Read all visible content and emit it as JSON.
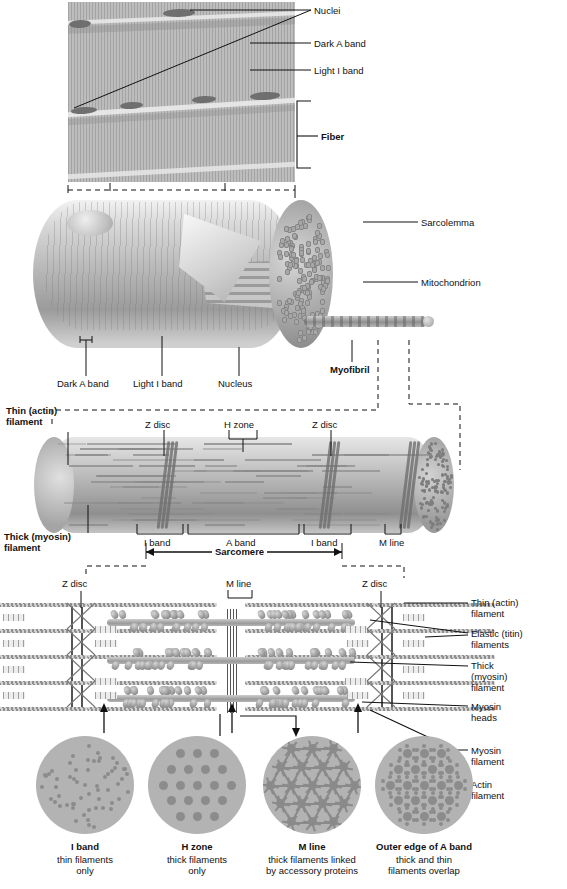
{
  "figure": {
    "domain": "anatomy-diagram"
  },
  "panel_micrograph": {
    "name": "photomicrograph-of-muscle-fibers",
    "labels": [
      {
        "id": "nuclei",
        "text": "Nuclei"
      },
      {
        "id": "dark-a-band",
        "text": "Dark A band"
      },
      {
        "id": "light-i-band",
        "text": "Light I band"
      },
      {
        "id": "fiber",
        "text": "Fiber",
        "bold": true
      }
    ]
  },
  "panel_fiber": {
    "name": "muscle-fiber-cutaway",
    "labels": [
      {
        "id": "sarcolemma",
        "text": "Sarcolemma"
      },
      {
        "id": "mitochondrion",
        "text": "Mitochondrion"
      },
      {
        "id": "myofibril",
        "text": "Myofibril",
        "bold": true
      },
      {
        "id": "dark-a-band",
        "text": "Dark A band"
      },
      {
        "id": "light-i-band",
        "text": "Light I band"
      },
      {
        "id": "nucleus",
        "text": "Nucleus"
      }
    ]
  },
  "panel_myofibril": {
    "name": "myofibril-sarcomere-structure",
    "labels": [
      {
        "id": "thin-actin-filament",
        "line1": "Thin (actin)",
        "line2": "filament",
        "bold": true
      },
      {
        "id": "thick-myosin-filament",
        "line1": "Thick (myosin)",
        "line2": "filament",
        "bold": true
      },
      {
        "id": "z-disc-left",
        "text": "Z disc"
      },
      {
        "id": "h-zone",
        "text": "H zone"
      },
      {
        "id": "z-disc-right",
        "text": "Z disc"
      },
      {
        "id": "i-band-left",
        "text": "I band"
      },
      {
        "id": "a-band",
        "text": "A band"
      },
      {
        "id": "i-band-right",
        "text": "I band"
      },
      {
        "id": "m-line",
        "text": "M line"
      },
      {
        "id": "sarcomere",
        "text": "Sarcomere",
        "bold": true
      }
    ]
  },
  "panel_filaments": {
    "name": "sarcomere-filament-arrangement",
    "labels": [
      {
        "id": "z-disc-left",
        "text": "Z disc"
      },
      {
        "id": "m-line",
        "text": "M line"
      },
      {
        "id": "z-disc-right",
        "text": "Z disc"
      },
      {
        "id": "thin-actin-filament",
        "line1": "Thin (actin)",
        "line2": "filament"
      },
      {
        "id": "elastic-titin-filaments",
        "line1": "Elastic (titin)",
        "line2": "filaments"
      },
      {
        "id": "thick-myosin-filament",
        "line1": "Thick",
        "line2": "(myosin)",
        "line3": "filament"
      },
      {
        "id": "myosin-heads",
        "line1": "Myosin",
        "line2": "heads"
      }
    ]
  },
  "panel_cross_sections": {
    "name": "cross-section-views",
    "side_labels": [
      {
        "id": "myosin-filament",
        "line1": "Myosin",
        "line2": "filament"
      },
      {
        "id": "actin-filament",
        "line1": "Actin",
        "line2": "filament"
      }
    ],
    "sections": [
      {
        "id": "i-band",
        "title": "I band",
        "desc1": "thin filaments",
        "desc2": "only"
      },
      {
        "id": "h-zone",
        "title": "H zone",
        "desc1": "thick filaments",
        "desc2": "only"
      },
      {
        "id": "m-line",
        "title": "M line",
        "desc1": "thick filaments linked",
        "desc2": "by accessory proteins"
      },
      {
        "id": "outer-edge-a-band",
        "title": "Outer edge of A band",
        "desc1": "thick and thin",
        "desc2": "filaments overlap"
      }
    ]
  },
  "colors": {
    "ink": "#111111",
    "tissue_gray": "#b3b3b3",
    "filament_gray": "#8c8c8c",
    "background": "#ffffff"
  }
}
